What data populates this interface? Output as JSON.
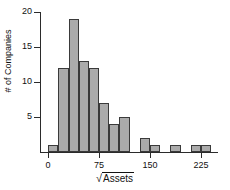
{
  "chart_data": {
    "type": "bar",
    "title": "",
    "subtitle": "",
    "xlabel": "√Assets",
    "xlabel_radical": "√",
    "xlabel_radicand": "Assets",
    "ylabel": "# of Companies",
    "grid": false,
    "legend": null,
    "xlim": [
      -12,
      250
    ],
    "ylim": [
      0,
      20
    ],
    "bin_width": 15,
    "xticks": [
      0,
      75,
      150,
      225
    ],
    "xtick_labels": [
      "0",
      "75",
      "150",
      "225"
    ],
    "yticks": [
      5,
      10,
      15,
      20
    ],
    "ytick_labels": [
      "5",
      "10",
      "15",
      "20"
    ],
    "bin_starts": [
      0,
      15,
      30,
      45,
      60,
      75,
      90,
      105,
      120,
      135,
      150,
      165,
      180,
      195,
      210,
      225
    ],
    "categories": [
      "0-15",
      "15-30",
      "30-45",
      "45-60",
      "60-75",
      "75-90",
      "90-105",
      "105-120",
      "120-135",
      "135-150",
      "150-165",
      "165-180",
      "180-195",
      "195-210",
      "210-225",
      "225-240"
    ],
    "values": [
      1,
      12,
      19,
      13,
      12,
      7,
      4,
      5,
      0,
      2,
      1,
      0,
      1,
      0,
      1,
      1
    ],
    "bar_fill": "#ababab",
    "bar_stroke": "#3a3a3a",
    "axis_color": "#2b2b2b"
  }
}
